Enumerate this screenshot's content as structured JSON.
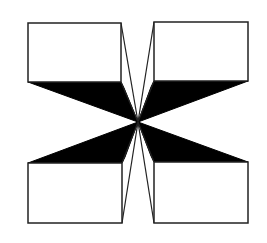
{
  "figure": {
    "colors": {
      "background": "#ffffff",
      "stroke": "#222222",
      "fill_dark": "#000000"
    },
    "center": [
      138,
      122
    ],
    "boxes": [
      {
        "name": "top-left",
        "x1": 28,
        "y1": 23,
        "x2": 121,
        "y2": 82
      },
      {
        "name": "top-right",
        "x1": 154,
        "y1": 22,
        "x2": 248,
        "y2": 81
      },
      {
        "name": "bottom-left",
        "x1": 28,
        "y1": 163,
        "x2": 122,
        "y2": 223
      },
      {
        "name": "bottom-right",
        "x1": 154,
        "y1": 162,
        "x2": 248,
        "y2": 223
      }
    ]
  }
}
